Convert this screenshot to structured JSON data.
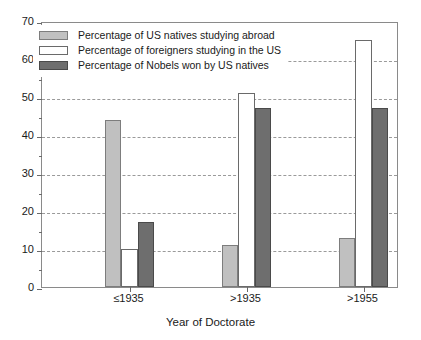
{
  "chart_data": {
    "type": "bar",
    "title": "",
    "xlabel": "Year of Doctorate",
    "ylabel": "",
    "categories": [
      "≤1935",
      ">1935",
      ">1955"
    ],
    "series": [
      {
        "name": "Percentage of US natives studying abroad",
        "color": "#c0c0c0",
        "values": [
          44,
          11,
          13
        ]
      },
      {
        "name": "Percentage of foreigners studying in the US",
        "color": "#ffffff",
        "values": [
          10,
          51,
          65
        ]
      },
      {
        "name": "Percentage of Nobels won by US natives",
        "color": "#6e6e6e",
        "values": [
          17,
          47,
          47
        ]
      }
    ],
    "ylim": [
      0,
      70
    ],
    "ytick_labels": [
      "0",
      "10",
      "20",
      "30",
      "40",
      "50",
      "60",
      "70"
    ],
    "ytick_values": [
      0,
      10,
      20,
      30,
      40,
      50,
      60,
      70
    ],
    "yminor_values": [
      5,
      15,
      25,
      35,
      45,
      55,
      65
    ],
    "grid": true,
    "grid_axis": "y",
    "legend_position": "upper-left"
  },
  "axis": {
    "x_title": "Year of Doctorate"
  },
  "legend": {
    "items": [
      {
        "label": "Percentage of US natives studying abroad",
        "swatch": "light"
      },
      {
        "label": "Percentage of foreigners studying in the US",
        "swatch": "white"
      },
      {
        "label": "Percentage of Nobels won by US natives",
        "swatch": "dark"
      }
    ]
  }
}
